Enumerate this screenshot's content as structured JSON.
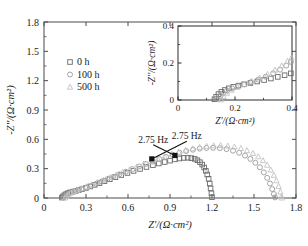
{
  "chart_data": {
    "type": "scatter",
    "title": "",
    "xlabel": "Z'/(Ω·cm²)",
    "ylabel": "-Z''/(Ω·cm²)",
    "xlim": [
      0,
      1.8
    ],
    "ylim": [
      0,
      1.8
    ],
    "xticks": [
      "0",
      "0.3",
      "0.6",
      "0.9",
      "1.2",
      "1.5",
      "1.8"
    ],
    "yticks": [
      "0",
      "0.3",
      "0.6",
      "0.9",
      "1.2",
      "1.5",
      "1.8"
    ],
    "xtick_values": [
      0,
      0.3,
      0.6,
      0.9,
      1.2,
      1.5,
      1.8
    ],
    "ytick_values": [
      0,
      0.3,
      0.6,
      0.9,
      1.2,
      1.5,
      1.8
    ],
    "grid": false,
    "legend_position": "upper-left",
    "legend": [
      "0 h",
      "100 h",
      "500 h"
    ],
    "annotations": [
      {
        "text": "2.75 Hz",
        "x": 0.78,
        "y": 0.565,
        "point_x": 0.935,
        "point_y": 0.435
      },
      {
        "text": "2.75 Hz",
        "x": 1.02,
        "y": 0.6,
        "point_x": 0.77,
        "point_y": 0.4
      }
    ],
    "series": [
      {
        "name": "0 h",
        "marker": "square",
        "color": "#6b6b6b",
        "points": [
          [
            0.128,
            0.004
          ],
          [
            0.136,
            0.016
          ],
          [
            0.146,
            0.028
          ],
          [
            0.158,
            0.04
          ],
          [
            0.172,
            0.05
          ],
          [
            0.188,
            0.058
          ],
          [
            0.206,
            0.065
          ],
          [
            0.226,
            0.072
          ],
          [
            0.248,
            0.08
          ],
          [
            0.272,
            0.09
          ],
          [
            0.3,
            0.103
          ],
          [
            0.33,
            0.118
          ],
          [
            0.362,
            0.134
          ],
          [
            0.396,
            0.152
          ],
          [
            0.432,
            0.172
          ],
          [
            0.47,
            0.192
          ],
          [
            0.51,
            0.213
          ],
          [
            0.552,
            0.235
          ],
          [
            0.596,
            0.256
          ],
          [
            0.64,
            0.277
          ],
          [
            0.686,
            0.297
          ],
          [
            0.732,
            0.317
          ],
          [
            0.778,
            0.336
          ],
          [
            0.82,
            0.353
          ],
          [
            0.862,
            0.368
          ],
          [
            0.9,
            0.382
          ],
          [
            0.935,
            0.395
          ],
          [
            0.968,
            0.404
          ],
          [
            0.998,
            0.41
          ],
          [
            1.026,
            0.412
          ],
          [
            1.052,
            0.408
          ],
          [
            1.076,
            0.4
          ],
          [
            1.096,
            0.386
          ],
          [
            1.114,
            0.366
          ],
          [
            1.13,
            0.342
          ],
          [
            1.144,
            0.312
          ],
          [
            1.156,
            0.278
          ],
          [
            1.166,
            0.24
          ],
          [
            1.176,
            0.196
          ],
          [
            1.184,
            0.148
          ],
          [
            1.19,
            0.098
          ],
          [
            1.196,
            0.048
          ],
          [
            1.2,
            0.008
          ]
        ]
      },
      {
        "name": "100 h",
        "marker": "circle",
        "color": "#9a9a9a",
        "points": [
          [
            0.14,
            0.004
          ],
          [
            0.15,
            0.018
          ],
          [
            0.162,
            0.034
          ],
          [
            0.178,
            0.048
          ],
          [
            0.196,
            0.06
          ],
          [
            0.218,
            0.07
          ],
          [
            0.244,
            0.08
          ],
          [
            0.272,
            0.092
          ],
          [
            0.304,
            0.108
          ],
          [
            0.338,
            0.126
          ],
          [
            0.374,
            0.146
          ],
          [
            0.412,
            0.168
          ],
          [
            0.452,
            0.192
          ],
          [
            0.494,
            0.216
          ],
          [
            0.538,
            0.242
          ],
          [
            0.584,
            0.268
          ],
          [
            0.632,
            0.295
          ],
          [
            0.68,
            0.322
          ],
          [
            0.728,
            0.348
          ],
          [
            0.776,
            0.374
          ],
          [
            0.824,
            0.398
          ],
          [
            0.872,
            0.42
          ],
          [
            0.92,
            0.442
          ],
          [
            0.968,
            0.462
          ],
          [
            1.016,
            0.48
          ],
          [
            1.064,
            0.494
          ],
          [
            1.112,
            0.505
          ],
          [
            1.16,
            0.512
          ],
          [
            1.208,
            0.514
          ],
          [
            1.256,
            0.51
          ],
          [
            1.304,
            0.5
          ],
          [
            1.35,
            0.484
          ],
          [
            1.394,
            0.462
          ],
          [
            1.436,
            0.434
          ],
          [
            1.474,
            0.4
          ],
          [
            1.51,
            0.36
          ],
          [
            1.542,
            0.314
          ],
          [
            1.57,
            0.262
          ],
          [
            1.594,
            0.206
          ],
          [
            1.614,
            0.148
          ],
          [
            1.63,
            0.092
          ],
          [
            1.642,
            0.04
          ],
          [
            1.65,
            0.006
          ]
        ]
      },
      {
        "name": "500 h",
        "marker": "triangle",
        "color": "#c2c2c2",
        "points": [
          [
            0.15,
            0.002
          ],
          [
            0.16,
            0.02
          ],
          [
            0.174,
            0.038
          ],
          [
            0.192,
            0.054
          ],
          [
            0.214,
            0.068
          ],
          [
            0.24,
            0.082
          ],
          [
            0.27,
            0.098
          ],
          [
            0.304,
            0.116
          ],
          [
            0.342,
            0.138
          ],
          [
            0.382,
            0.16
          ],
          [
            0.424,
            0.184
          ],
          [
            0.468,
            0.21
          ],
          [
            0.514,
            0.236
          ],
          [
            0.562,
            0.264
          ],
          [
            0.612,
            0.292
          ],
          [
            0.662,
            0.32
          ],
          [
            0.712,
            0.348
          ],
          [
            0.762,
            0.374
          ],
          [
            0.812,
            0.4
          ],
          [
            0.862,
            0.424
          ],
          [
            0.912,
            0.448
          ],
          [
            0.962,
            0.47
          ],
          [
            1.012,
            0.49
          ],
          [
            1.062,
            0.506
          ],
          [
            1.112,
            0.52
          ],
          [
            1.162,
            0.53
          ],
          [
            1.212,
            0.536
          ],
          [
            1.262,
            0.538
          ],
          [
            1.312,
            0.534
          ],
          [
            1.36,
            0.524
          ],
          [
            1.406,
            0.508
          ],
          [
            1.45,
            0.486
          ],
          [
            1.492,
            0.458
          ],
          [
            1.53,
            0.424
          ],
          [
            1.564,
            0.384
          ],
          [
            1.594,
            0.338
          ],
          [
            1.62,
            0.288
          ],
          [
            1.642,
            0.234
          ],
          [
            1.66,
            0.178
          ],
          [
            1.676,
            0.12
          ],
          [
            1.688,
            0.064
          ],
          [
            1.696,
            0.018
          ],
          [
            1.7,
            0.002
          ]
        ]
      }
    ]
  },
  "inset": {
    "xlabel": "Z'/(Ω·cm²)",
    "ylabel": "-Z''/(Ω·cm²)",
    "xlim": [
      0,
      0.4
    ],
    "ylim": [
      0,
      0.4
    ],
    "xticks": [
      "0",
      "0.2",
      "0.4"
    ],
    "yticks": [
      "0",
      "0.2",
      "0.4"
    ],
    "xtick_values": [
      0,
      0.2,
      0.4
    ],
    "ytick_values": [
      0,
      0.2,
      0.4
    ],
    "series": [
      {
        "name": "0 h",
        "marker": "square",
        "color": "#6b6b6b",
        "points": [
          [
            0.128,
            0.004
          ],
          [
            0.134,
            0.018
          ],
          [
            0.142,
            0.032
          ],
          [
            0.152,
            0.044
          ],
          [
            0.164,
            0.054
          ],
          [
            0.178,
            0.063
          ],
          [
            0.194,
            0.071
          ],
          [
            0.212,
            0.078
          ],
          [
            0.232,
            0.085
          ],
          [
            0.254,
            0.092
          ],
          [
            0.278,
            0.1
          ],
          [
            0.302,
            0.108
          ],
          [
            0.326,
            0.116
          ],
          [
            0.35,
            0.125
          ],
          [
            0.374,
            0.134
          ],
          [
            0.396,
            0.144
          ]
        ]
      },
      {
        "name": "100 h",
        "marker": "circle",
        "color": "#9a9a9a",
        "points": [
          [
            0.14,
            0.004
          ],
          [
            0.148,
            0.02
          ],
          [
            0.158,
            0.036
          ],
          [
            0.172,
            0.05
          ],
          [
            0.19,
            0.063
          ],
          [
            0.21,
            0.074
          ],
          [
            0.232,
            0.084
          ],
          [
            0.256,
            0.096
          ],
          [
            0.282,
            0.11
          ],
          [
            0.308,
            0.126
          ],
          [
            0.334,
            0.144
          ],
          [
            0.358,
            0.164
          ],
          [
            0.38,
            0.186
          ],
          [
            0.396,
            0.206
          ]
        ]
      },
      {
        "name": "500 h",
        "marker": "triangle",
        "color": "#c2c2c2",
        "points": [
          [
            0.152,
            0.002
          ],
          [
            0.16,
            0.02
          ],
          [
            0.172,
            0.038
          ],
          [
            0.188,
            0.054
          ],
          [
            0.208,
            0.07
          ],
          [
            0.232,
            0.086
          ],
          [
            0.258,
            0.102
          ],
          [
            0.286,
            0.12
          ],
          [
            0.314,
            0.14
          ],
          [
            0.34,
            0.162
          ],
          [
            0.364,
            0.186
          ],
          [
            0.384,
            0.21
          ],
          [
            0.398,
            0.228
          ]
        ]
      }
    ]
  }
}
